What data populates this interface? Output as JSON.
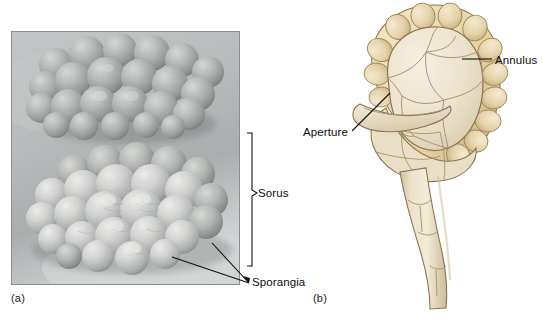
{
  "figure": {
    "background_color": "#ffffff"
  },
  "panel_a": {
    "id_label": "(a)",
    "type": "scanning-electron-micrograph",
    "subject": "clusters of fern sporangia forming sori",
    "border_color": "#8d8d8d",
    "callouts": [
      {
        "name": "sorus",
        "label": "Sorus",
        "marker": "bracket",
        "bracket_top_y": 133,
        "bracket_bottom_y": 266
      },
      {
        "name": "sporangia",
        "label": "Sporangia",
        "marker": "leader-lines",
        "leader_count": 2
      }
    ]
  },
  "panel_b": {
    "id_label": "(b)",
    "type": "illustration",
    "subject": "single fern sporangium in longitudinal view",
    "colors": {
      "annulus": "#e9d5a4",
      "annulus_shadow": "#d4bb84",
      "capsule": "#efe6d2",
      "capsule_shade": "#d9ccb2",
      "stalk": "#e6dcc2",
      "outline": "#8a7450",
      "cell_wall": "#a08a62"
    },
    "callouts": [
      {
        "name": "annulus",
        "label": "Annulus",
        "marker": "horizontal-leader"
      },
      {
        "name": "aperture",
        "label": "Aperture",
        "marker": "diagonal-leader"
      }
    ]
  }
}
